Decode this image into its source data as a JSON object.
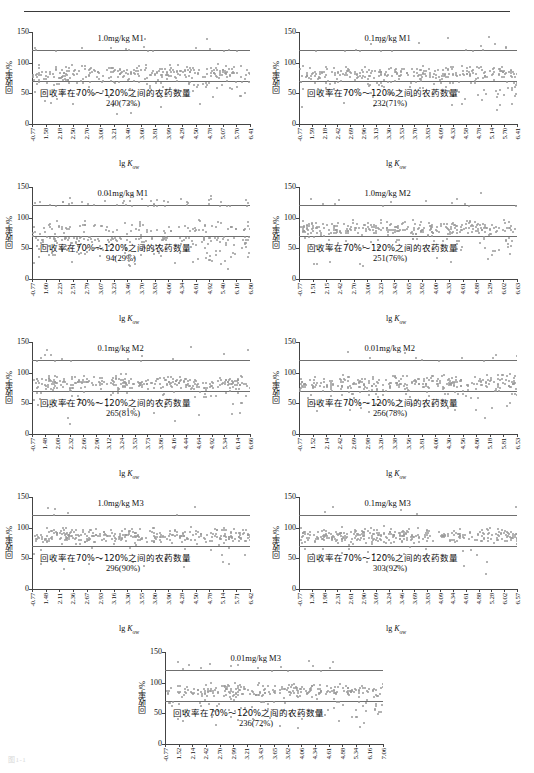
{
  "figure": {
    "y_axis_label": "回收率/%",
    "x_axis_label_prefix": "lg ",
    "x_axis_label_symbol": "K",
    "x_axis_label_sub": "ow",
    "y_ticks": [
      "0",
      "50",
      "100",
      "150"
    ],
    "y_min": 0,
    "y_max": 150,
    "band_low": 70,
    "band_high": 120,
    "note_prefix": "回收率在70%～120%之间的农药数量",
    "point_color": "#9a9a9a",
    "band_line_color": "#6f6f6f",
    "axis_color": "#444444",
    "caption": "图1-1"
  },
  "chart_data": [
    {
      "type": "scatter",
      "title": "1.0mg/kg M1",
      "ylabel": "回收率/%",
      "xlabel": "lg Kow",
      "ylim": [
        0,
        150
      ],
      "yticks": [
        0,
        50,
        100,
        150
      ],
      "band": [
        70,
        120
      ],
      "count_label": "240(73%)",
      "count": 240,
      "percent": 73,
      "note": "回收率在70%～120%之间的农药数量",
      "xticklabels": [
        "-0.77",
        "1.58",
        "2.18",
        "2.50",
        "2.70",
        "3.00",
        "3.21",
        "3.40",
        "3.60",
        "3.81",
        "3.99",
        "4.29",
        "4.50",
        "4.78",
        "5.07",
        "5.70",
        "6.41"
      ]
    },
    {
      "type": "scatter",
      "title": "0.1mg/kg M1",
      "ylabel": "回收率/%",
      "xlabel": "lg Kow",
      "ylim": [
        0,
        150
      ],
      "yticks": [
        0,
        50,
        100,
        150
      ],
      "band": [
        70,
        120
      ],
      "count_label": "232(71%)",
      "count": 232,
      "percent": 71,
      "note": "回收率在70%～120%之间的农药数量",
      "xticklabels": [
        "-0.77",
        "1.59",
        "2.18",
        "2.42",
        "2.69",
        "2.96",
        "3.13",
        "3.30",
        "3.53",
        "3.70",
        "3.83",
        "4.09",
        "4.33",
        "4.58",
        "4.78",
        "5.14",
        "5.70",
        "6.41"
      ]
    },
    {
      "type": "scatter",
      "title": "0.01mg/kg M1",
      "ylabel": "回收率/%",
      "xlabel": "lg Kow",
      "ylim": [
        0,
        150
      ],
      "yticks": [
        0,
        50,
        100,
        150
      ],
      "band": [
        70,
        120
      ],
      "count_label": "94(29%)",
      "count": 94,
      "percent": 29,
      "note": "回收率在70%～120%之间的农药数量",
      "xticklabels": [
        "-0.77",
        "1.60",
        "2.23",
        "2.51",
        "2.79",
        "3.07",
        "3.23",
        "3.46",
        "3.70",
        "3.83",
        "4.06",
        "4.34",
        "4.61",
        "4.92",
        "5.40",
        "6.16",
        "6.80"
      ]
    },
    {
      "type": "scatter",
      "title": "1.0mg/kg M2",
      "ylabel": "回收率/%",
      "xlabel": "lg Kow",
      "ylim": [
        0,
        150
      ],
      "yticks": [
        0,
        50,
        100,
        150
      ],
      "band": [
        70,
        120
      ],
      "count_label": "251(76%)",
      "count": 251,
      "percent": 76,
      "note": "回收率在70%～120%之间的农药数量",
      "xticklabels": [
        "-0.77",
        "1.51",
        "2.15",
        "2.42",
        "2.70",
        "3.00",
        "3.23",
        "3.43",
        "3.65",
        "3.82",
        "4.00",
        "4.33",
        "4.61",
        "4.88",
        "5.29",
        "6.02",
        "6.63"
      ]
    },
    {
      "type": "scatter",
      "title": "0.1mg/kg M2",
      "ylabel": "回收率/%",
      "xlabel": "lg Kow",
      "ylim": [
        0,
        150
      ],
      "yticks": [
        0,
        50,
        100,
        150
      ],
      "band": [
        70,
        120
      ],
      "count_label": "265(81%)",
      "count": 265,
      "percent": 81,
      "note": "回收率在70%～120%之间的农药数量",
      "xticklabels": [
        "-0.77",
        "1.48",
        "2.08",
        "2.32",
        "2.66",
        "2.90",
        "3.12",
        "3.24",
        "3.53",
        "3.73",
        "3.86",
        "4.16",
        "4.44",
        "4.64",
        "4.92",
        "5.34",
        "6.14",
        "6.66"
      ]
    },
    {
      "type": "scatter",
      "title": "0.01mg/kg M2",
      "ylabel": "回收率/%",
      "xlabel": "lg Kow",
      "ylim": [
        0,
        150
      ],
      "yticks": [
        0,
        50,
        100,
        150
      ],
      "band": [
        70,
        120
      ],
      "count_label": "256(78%)",
      "count": 256,
      "percent": 78,
      "note": "回收率在70%～120%之间的农药数量",
      "xticklabels": [
        "-0.77",
        "1.52",
        "2.14",
        "2.42",
        "2.69",
        "2.98",
        "3.20",
        "3.38",
        "3.56",
        "3.81",
        "4.00",
        "4.30",
        "4.56",
        "4.80",
        "5.18",
        "5.81",
        "6.53"
      ]
    },
    {
      "type": "scatter",
      "title": "1.0mg/kg M3",
      "ylabel": "回收率/%",
      "xlabel": "lg Kow",
      "ylim": [
        0,
        150
      ],
      "yticks": [
        0,
        50,
        100,
        150
      ],
      "band": [
        70,
        120
      ],
      "count_label": "296(90%)",
      "count": 296,
      "percent": 90,
      "note": "回收率在70%～120%之间的农药数量",
      "xticklabels": [
        "-0.77",
        "1.48",
        "2.11",
        "2.36",
        "2.67",
        "2.93",
        "3.16",
        "3.30",
        "3.55",
        "3.80",
        "3.90",
        "4.28",
        "4.50",
        "4.78",
        "5.14",
        "5.71",
        "6.42"
      ]
    },
    {
      "type": "scatter",
      "title": "0.1mg/kg M3",
      "ylabel": "回收率/%",
      "xlabel": "lg Kow",
      "ylim": [
        0,
        150
      ],
      "yticks": [
        0,
        50,
        100,
        150
      ],
      "band": [
        70,
        120
      ],
      "count_label": "303(92%)",
      "count": 303,
      "percent": 92,
      "note": "回收率在70%～120%之间的农药数量",
      "xticklabels": [
        "-0.77",
        "1.36",
        "1.98",
        "2.31",
        "2.61",
        "2.90",
        "3.09",
        "3.24",
        "3.46",
        "3.69",
        "3.83",
        "4.09",
        "4.34",
        "4.61",
        "4.88",
        "5.28",
        "6.02",
        "6.57"
      ]
    },
    {
      "type": "scatter",
      "title": "0.01mg/kg M3",
      "ylabel": "回收率/%",
      "xlabel": "lg Kow",
      "ylim": [
        0,
        150
      ],
      "yticks": [
        0,
        50,
        100,
        150
      ],
      "band": [
        70,
        120
      ],
      "count_label": "236(72%)",
      "count": 236,
      "percent": 72,
      "note": "回收率在70%～120%之间的农药数量",
      "xticklabels": [
        "-0.77",
        "1.52",
        "2.14",
        "2.42",
        "2.70",
        "2.99",
        "3.21",
        "3.43",
        "3.65",
        "3.82",
        "4.06",
        "4.34",
        "4.61",
        "4.88",
        "5.34",
        "6.16",
        "7.06"
      ]
    }
  ]
}
